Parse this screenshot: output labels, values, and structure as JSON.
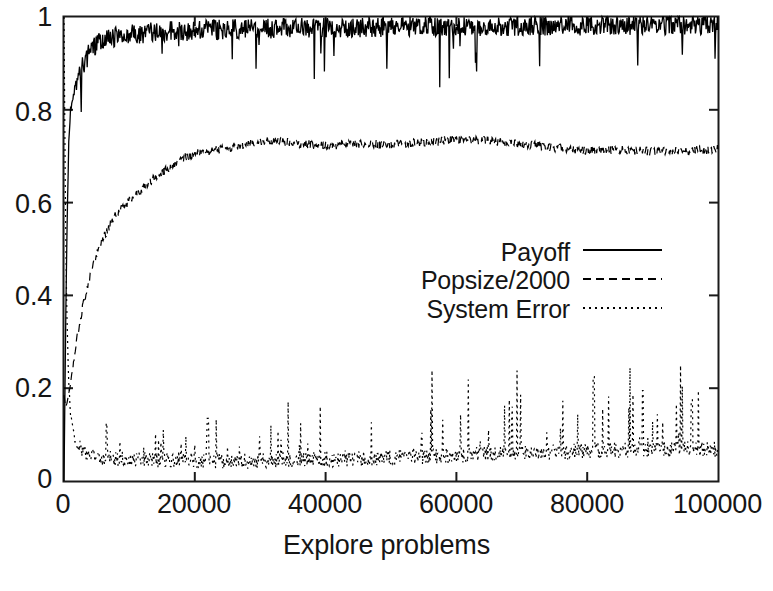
{
  "chart_data": {
    "type": "line",
    "title": "",
    "xlabel": "Explore problems",
    "ylabel": "",
    "xlim": [
      0,
      100000
    ],
    "ylim": [
      0,
      1
    ],
    "grid": false,
    "legend_position": "center-right inside plot",
    "xticks": [
      {
        "value": 0,
        "label": "0"
      },
      {
        "value": 20000,
        "label": "20000"
      },
      {
        "value": 40000,
        "label": "40000"
      },
      {
        "value": 60000,
        "label": "60000"
      },
      {
        "value": 80000,
        "label": "80000"
      },
      {
        "value": 100000,
        "label": "100000"
      }
    ],
    "yticks": [
      {
        "value": 0,
        "label": "0"
      },
      {
        "value": 0.2,
        "label": "0.2"
      },
      {
        "value": 0.4,
        "label": "0.4"
      },
      {
        "value": 0.6,
        "label": "0.6"
      },
      {
        "value": 0.8,
        "label": "0.8"
      },
      {
        "value": 1,
        "label": "1"
      }
    ],
    "series": [
      {
        "name": "Payoff",
        "style": "solid",
        "color": "#000000",
        "noise": 0.022,
        "spike_down": 0.11,
        "x": [
          0,
          250,
          500,
          750,
          1000,
          1500,
          2000,
          2500,
          3000,
          4000,
          5000,
          6000,
          8000,
          10000,
          15000,
          20000,
          25000,
          30000,
          35000,
          40000,
          45000,
          50000,
          55000,
          60000,
          65000,
          70000,
          75000,
          80000,
          85000,
          90000,
          95000,
          100000
        ],
        "values": [
          0.0,
          0.33,
          0.58,
          0.74,
          0.8,
          0.84,
          0.86,
          0.88,
          0.9,
          0.925,
          0.94,
          0.95,
          0.958,
          0.963,
          0.968,
          0.971,
          0.973,
          0.975,
          0.976,
          0.977,
          0.978,
          0.979,
          0.98,
          0.98,
          0.981,
          0.981,
          0.982,
          0.982,
          0.983,
          0.983,
          0.984,
          0.984
        ]
      },
      {
        "name": "Popsize/2000",
        "style": "dashed",
        "color": "#000000",
        "noise": 0.009,
        "spike_down": 0.0,
        "x": [
          0,
          250,
          500,
          1000,
          1500,
          2000,
          3000,
          4000,
          5000,
          6000,
          8000,
          10000,
          12000,
          14000,
          16000,
          18000,
          20000,
          24000,
          28000,
          32000,
          36000,
          40000,
          45000,
          50000,
          55000,
          60000,
          65000,
          70000,
          75000,
          80000,
          85000,
          90000,
          95000,
          100000
        ],
        "values": [
          0.185,
          0.16,
          0.17,
          0.21,
          0.26,
          0.31,
          0.385,
          0.44,
          0.49,
          0.525,
          0.575,
          0.605,
          0.63,
          0.655,
          0.675,
          0.695,
          0.705,
          0.715,
          0.725,
          0.735,
          0.727,
          0.722,
          0.727,
          0.725,
          0.73,
          0.736,
          0.733,
          0.727,
          0.718,
          0.712,
          0.714,
          0.71,
          0.712,
          0.715
        ]
      },
      {
        "name": "System Error",
        "style": "dotted",
        "color": "#000000",
        "noise": 0.017,
        "spike_up_start": 0.035,
        "spike_up_end": 0.155,
        "x": [
          0,
          200,
          400,
          700,
          1000,
          1500,
          2000,
          3000,
          5000,
          8000,
          10000,
          15000,
          20000,
          25000,
          30000,
          35000,
          40000,
          45000,
          50000,
          55000,
          60000,
          65000,
          70000,
          75000,
          80000,
          85000,
          90000,
          95000,
          100000
        ],
        "values": [
          1.0,
          0.62,
          0.38,
          0.22,
          0.145,
          0.1,
          0.082,
          0.062,
          0.05,
          0.048,
          0.046,
          0.045,
          0.044,
          0.043,
          0.044,
          0.045,
          0.046,
          0.048,
          0.05,
          0.052,
          0.055,
          0.058,
          0.06,
          0.062,
          0.065,
          0.066,
          0.068,
          0.07,
          0.068
        ]
      }
    ],
    "notable_spikes": [
      {
        "series": "System Error",
        "x": 6500,
        "y": 0.125
      },
      {
        "series": "System Error",
        "x": 22000,
        "y": 0.135
      },
      {
        "series": "System Error",
        "x": 81000,
        "y": 0.225
      },
      {
        "series": "System Error",
        "x": 88500,
        "y": 0.195
      },
      {
        "series": "System Error",
        "x": 96000,
        "y": 0.175
      }
    ]
  },
  "legend": {
    "entries": [
      {
        "label": "Payoff",
        "style": "solid"
      },
      {
        "label": "Popsize/2000",
        "style": "dashed"
      },
      {
        "label": "System Error",
        "style": "dotted"
      }
    ]
  },
  "axes": {
    "xlabel": "Explore problems",
    "x_tick_labels": [
      "0",
      "20000",
      "40000",
      "60000",
      "80000",
      "100000"
    ],
    "y_tick_labels": [
      "0",
      "0.2",
      "0.4",
      "0.6",
      "0.8",
      "1"
    ]
  }
}
